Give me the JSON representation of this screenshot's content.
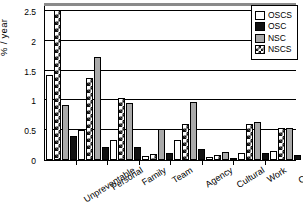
{
  "chart_data": {
    "type": "bar",
    "title": "",
    "xlabel": "",
    "ylabel": "% / year",
    "ylim": [
      0,
      2.6
    ],
    "yticks": [
      0,
      0.5,
      1,
      1.5,
      2,
      2.5
    ],
    "ytick_labels": [
      "0",
      "0.5",
      "1",
      "1.5",
      "2",
      "2.5"
    ],
    "grid": true,
    "legend_position": "top-right",
    "categories": [
      "Unpreventable",
      "Personal",
      "Family",
      "Team",
      "Agency",
      "Cultural",
      "Work",
      "Other"
    ],
    "series": [
      {
        "name": "OSCS",
        "color": "#ffffff",
        "pattern": "solid-white",
        "values": [
          1.43,
          0.5,
          0.33,
          0.07,
          0.34,
          0.05,
          0.12,
          0.15
        ]
      },
      {
        "name": "NSCS",
        "color": "#111111",
        "pattern": "checkered",
        "values": [
          2.52,
          1.37,
          1.04,
          0.1,
          0.6,
          0.08,
          0.6,
          0.53
        ]
      },
      {
        "name": "NSC",
        "color": "#a9a9a9",
        "pattern": "solid-gray",
        "values": [
          0.93,
          1.73,
          0.96,
          0.52,
          0.97,
          0.13,
          0.64,
          0.53
        ]
      },
      {
        "name": "OSC",
        "color": "#111111",
        "pattern": "solid-black",
        "values": [
          0.41,
          0.21,
          0.21,
          0.12,
          0.19,
          0.03,
          0.11,
          0.08
        ]
      }
    ]
  },
  "legend": {
    "items": [
      {
        "label": "OSCS",
        "style": "oscs"
      },
      {
        "label": "OSC",
        "style": "osc"
      },
      {
        "label": "NSC",
        "style": "nsc"
      },
      {
        "label": "NSCS",
        "style": "nscs"
      }
    ]
  }
}
